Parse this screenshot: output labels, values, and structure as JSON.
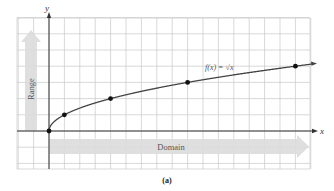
{
  "chart_data": {
    "type": "line",
    "title": "",
    "function_label": "f(x) = √x",
    "xlabel": "x",
    "ylabel": "y",
    "series": [
      {
        "name": "f(x) = √x",
        "x": [
          0,
          1,
          4,
          9,
          16
        ],
        "y": [
          0,
          1,
          2,
          3,
          4
        ]
      }
    ],
    "marked_points": [
      [
        0,
        0
      ],
      [
        1,
        1
      ],
      [
        4,
        2
      ],
      [
        9,
        3
      ],
      [
        16,
        4
      ]
    ],
    "xlim": [
      -2,
      17
    ],
    "ylim": [
      -2.4,
      7.2
    ],
    "grid": true,
    "annotations": [
      {
        "text": "Range",
        "type": "arrow",
        "direction": "up",
        "color": "#d9d9d9"
      },
      {
        "text": "Domain",
        "type": "arrow",
        "direction": "right",
        "color": "#d9d9d9"
      }
    ],
    "caption": "(a)"
  },
  "labels": {
    "x_axis": "x",
    "y_axis": "y",
    "range": "Range",
    "domain": "Domain",
    "function": "f(x) = √x",
    "caption": "(a)"
  },
  "colors": {
    "grid": "#c8c8c8",
    "axis": "#333333",
    "curve": "#444444",
    "band": "#dcdcdc",
    "text": "#555555"
  }
}
